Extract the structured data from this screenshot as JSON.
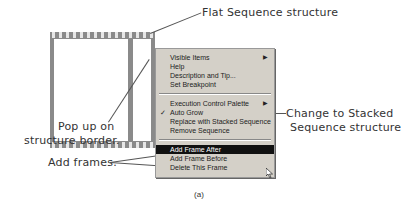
{
  "annotations": {
    "flat_sequence": "Flat Sequence structure",
    "popup_line1": "Pop up on",
    "popup_line2": "structure border.",
    "add_frames": "Add frames.",
    "change_line1": "Change to Stacked",
    "change_line2": "Sequence structure"
  },
  "menu": {
    "group1": [
      {
        "label": "Visible Items",
        "submenu": true
      },
      {
        "label": "Help"
      },
      {
        "label": "Description and Tip..."
      },
      {
        "label": "Set Breakpoint"
      }
    ],
    "group2": [
      {
        "label": "Execution Control Palette",
        "submenu": true
      },
      {
        "label": "Auto Grow",
        "checked": true
      },
      {
        "label": "Replace with Stacked Sequence"
      },
      {
        "label": "Remove Sequence"
      }
    ],
    "group3": [
      {
        "label": "Add Frame After",
        "selected": true
      },
      {
        "label": "Add Frame Before"
      },
      {
        "label": "Delete This Frame"
      }
    ],
    "arrow_glyph": "▶",
    "check_glyph": "✓"
  },
  "caption": "(a)"
}
